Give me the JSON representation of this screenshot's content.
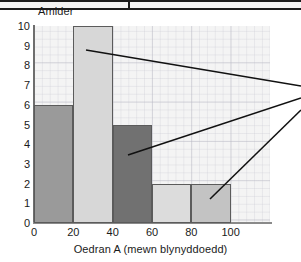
{
  "figure": {
    "top_rule_present": true,
    "background_color": "#f4f4f4",
    "axis_color": "#6e6e6e"
  },
  "chart_data": {
    "type": "bar",
    "title": "",
    "ylabel": "Amlder",
    "xlabel": "Oedran A (mewn blynyddoedd)",
    "grid": true,
    "legend": "none",
    "xlim": [
      0,
      120
    ],
    "ylim": [
      0,
      10
    ],
    "x_ticks": [
      0,
      20,
      40,
      60,
      80,
      100
    ],
    "y_ticks": [
      0,
      1,
      2,
      3,
      4,
      5,
      6,
      7,
      8,
      9,
      10
    ],
    "bin_edges": [
      0,
      20,
      40,
      60,
      80,
      100
    ],
    "categories": [
      "0-20",
      "20-40",
      "40-60",
      "60-80",
      "80-100"
    ],
    "values": [
      6,
      10,
      5,
      2,
      2
    ],
    "bar_colors": [
      "#9a9a9a",
      "#d7d7d7",
      "#717171",
      "#dcdcdc",
      "#c3c3c3"
    ],
    "bar_edge_color": "#5b5b5b",
    "annotations": [
      {
        "name": "leader-line-1",
        "x1": 86,
        "y1": 50,
        "x2": 301,
        "y2": 86
      },
      {
        "name": "leader-line-2",
        "x1": 128,
        "y1": 155,
        "x2": 301,
        "y2": 98
      },
      {
        "name": "leader-line-3",
        "x1": 210,
        "y1": 199,
        "x2": 301,
        "y2": 110
      }
    ]
  },
  "axis_labels": {
    "y_title": "Amlder",
    "x_title": "Oedran A (mewn blynyddoedd)",
    "y_values": [
      "10",
      "9",
      "8",
      "7",
      "6",
      "5",
      "4",
      "3",
      "2",
      "1",
      "0"
    ],
    "x_values": [
      "0",
      "20",
      "40",
      "60",
      "80",
      "100"
    ]
  }
}
